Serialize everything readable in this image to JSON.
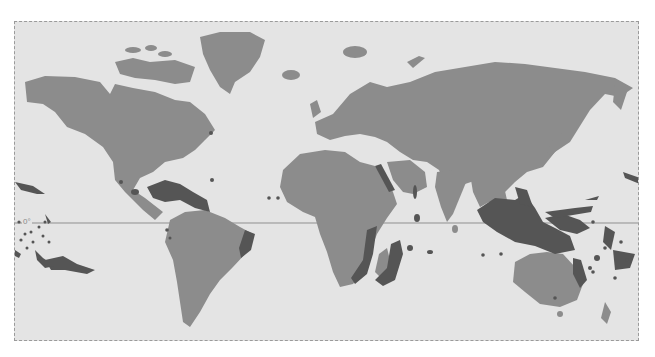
{
  "map": {
    "type": "world-map",
    "projection": "equirectangular",
    "equator_label": "0°",
    "colors": {
      "ocean": "#e4e4e4",
      "land": "#8c8c8c",
      "reef": "#555555",
      "reef_shelf": "#6e6e6e",
      "equator_line": "#8f8f8f",
      "frame": "#9a9a9a"
    },
    "highlighted_regions": [
      "Caribbean",
      "East Africa / Madagascar",
      "Red Sea",
      "Indian Ocean",
      "Southeast Asia / Coral Triangle",
      "Great Barrier Reef",
      "Western Pacific islands",
      "Central Pacific islands",
      "Brazil coast"
    ]
  }
}
